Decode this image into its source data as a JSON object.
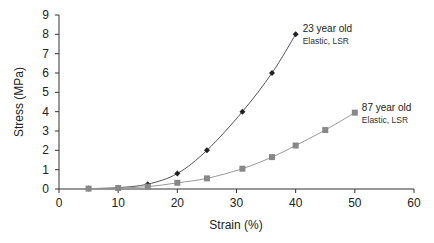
{
  "chart_data": {
    "type": "line",
    "title": "",
    "xlabel": "Strain (%)",
    "ylabel": "Stress (MPa)",
    "xlim": [
      0,
      60
    ],
    "ylim": [
      0,
      9
    ],
    "xticks": [
      0,
      10,
      20,
      30,
      40,
      50,
      60
    ],
    "yticks": [
      0,
      1,
      2,
      3,
      4,
      5,
      6,
      7,
      8,
      9
    ],
    "grid": false,
    "legend": "none (inline annotations at series ends)",
    "series": [
      {
        "name": "23 year old",
        "annotation": [
          "23 year old",
          "Elastic, LSR"
        ],
        "marker": "diamond",
        "color": "#222222",
        "x": [
          5,
          10,
          15,
          20,
          25,
          31,
          36,
          40
        ],
        "y": [
          0.02,
          0.07,
          0.25,
          0.8,
          2.0,
          4.0,
          6.0,
          8.0
        ]
      },
      {
        "name": "87 year old",
        "annotation": [
          "87 year old",
          "Elastic, LSR"
        ],
        "marker": "square",
        "color": "#888888",
        "x": [
          5,
          10,
          15,
          20,
          25,
          31,
          36,
          40,
          45,
          50
        ],
        "y": [
          0.02,
          0.05,
          0.12,
          0.32,
          0.55,
          1.05,
          1.65,
          2.25,
          3.05,
          3.95
        ]
      }
    ]
  }
}
